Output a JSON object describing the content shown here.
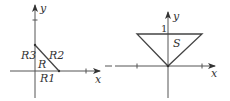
{
  "left_figure": {
    "axis_x_label": "x",
    "axis_y_label": "y",
    "regions": {
      "R": "R",
      "R1": "R1",
      "R2": "R2",
      "R3": "R3"
    }
  },
  "right_figure": {
    "axis_x_label": "x",
    "axis_y_label": "y",
    "tick_label_y": "1",
    "region_label": "S"
  },
  "colors": {
    "stroke": "#444444",
    "background": "#ffffff"
  }
}
